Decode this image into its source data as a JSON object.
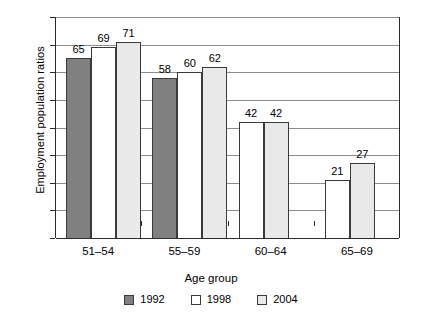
{
  "chart_data": {
    "type": "bar",
    "title": "",
    "subtitle": "",
    "xlabel": "Age group",
    "ylabel": "Employment population ratios",
    "categories": [
      "51–54",
      "55–59",
      "60–64",
      "65–69"
    ],
    "series": [
      {
        "name": "1992",
        "color": "#808080",
        "values": [
          65,
          58,
          null,
          null
        ]
      },
      {
        "name": "1998",
        "color": "#ffffff",
        "values": [
          69,
          60,
          42,
          21
        ]
      },
      {
        "name": "2004",
        "color": "#e9e9e9",
        "values": [
          71,
          62,
          42,
          27
        ]
      }
    ],
    "ylim": [
      0,
      80
    ],
    "ytick_step": 10,
    "yticks": [
      0,
      10,
      20,
      30,
      40,
      50,
      60,
      70,
      80
    ],
    "ytick_labels": [
      "0",
      "10",
      "20",
      "30",
      "40",
      "50",
      "60",
      "70",
      "80"
    ],
    "grid": true,
    "grid_axis": "y",
    "legend_position": "bottom-center",
    "data_labels": true,
    "bar_border_color": "#3a3a3a",
    "axis_color": "#2b2b2b",
    "grid_color": "#8d8d8d",
    "background_color": "#ffffff"
  },
  "axes": {
    "y_title": "Employment population ratios",
    "x_title": "Age group"
  },
  "legend": {
    "entries": [
      {
        "label": "1992",
        "swatch": "#808080"
      },
      {
        "label": "1998",
        "swatch": "#ffffff"
      },
      {
        "label": "2004",
        "swatch": "#e9e9e9"
      }
    ]
  }
}
